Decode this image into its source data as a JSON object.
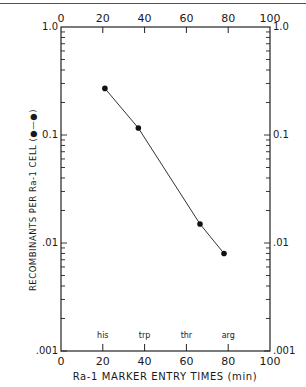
{
  "chart_data": {
    "type": "line",
    "title": "",
    "xlabel": "Ra-1 MARKER ENTRY TIMES (min)",
    "ylabel": "RECOMBINANTS PER Ra-1 CELL",
    "legend_symbol": "(●—●)",
    "xlim": [
      0,
      100
    ],
    "ylim": [
      0.001,
      1.0
    ],
    "yscale": "log",
    "x_ticks": [
      0,
      20,
      40,
      60,
      80,
      100
    ],
    "x_tick_labels": [
      "0",
      "20",
      "40",
      "60",
      "80",
      "100"
    ],
    "y_tick_labels": [
      "1.0",
      "0.1",
      ".01",
      ".001"
    ],
    "y_tick_labels_left": [
      "1.0",
      "0.1",
      ".01",
      ".001"
    ],
    "grid": false,
    "markers": [
      {
        "label": "his",
        "x": 20
      },
      {
        "label": "trp",
        "x": 40
      },
      {
        "label": "thr",
        "x": 60
      },
      {
        "label": "arg",
        "x": 80
      }
    ],
    "series": [
      {
        "name": "recombinants per Ra-1 cell",
        "points": [
          {
            "marker": "his",
            "x": 21,
            "y": 0.27
          },
          {
            "marker": "trp",
            "x": 37,
            "y": 0.116
          },
          {
            "marker": "thr",
            "x": 66.5,
            "y": 0.015
          },
          {
            "marker": "arg",
            "x": 78,
            "y": 0.008
          }
        ]
      }
    ]
  }
}
